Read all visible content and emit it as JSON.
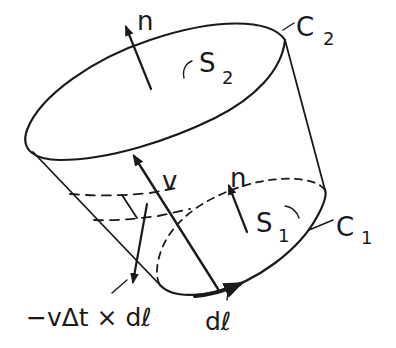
{
  "diagram": {
    "colors": {
      "ink": "#1a1a1a",
      "background": "#ffffff"
    },
    "labels": {
      "n_top": "n",
      "n_bottom": "n",
      "s2_main": "S",
      "s2_sub": "2",
      "s1_main": "S",
      "s1_sub": "1",
      "c2_main": "C",
      "c2_sub": "2",
      "c1_main": "C",
      "c1_sub": "1",
      "velocity": "v",
      "strip_vector": "−vΔt × dℓ",
      "dl": "dℓ"
    },
    "elements": [
      {
        "id": "top-surface",
        "label": "S2",
        "bounded_by": "C2",
        "normal": "n"
      },
      {
        "id": "bottom-surface",
        "label": "S1",
        "bounded_by": "C1",
        "normal": "n"
      },
      {
        "id": "velocity-vector",
        "label": "v"
      },
      {
        "id": "line-element",
        "label": "dℓ"
      },
      {
        "id": "side-strip-vector",
        "label": "−vΔt × dℓ"
      }
    ]
  }
}
